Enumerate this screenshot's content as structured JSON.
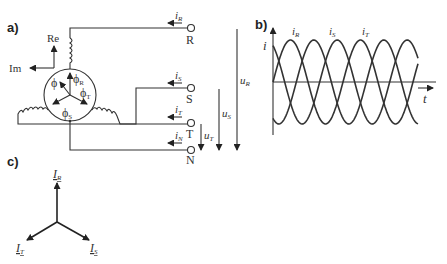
{
  "panels": {
    "a": {
      "label": "a)",
      "axes": {
        "re": "Re",
        "im": "Im"
      },
      "fluxes": [
        {
          "sym": "ϕ",
          "sub": "R"
        },
        {
          "sym": "ϕ",
          "sub": "T"
        },
        {
          "sym": "ϕ",
          "sub": "S"
        },
        {
          "sym": "ϕ",
          "sub": ""
        }
      ],
      "terminals": [
        {
          "name": "R",
          "current": "i",
          "current_sub": "R"
        },
        {
          "name": "S",
          "current": "i",
          "current_sub": "S"
        },
        {
          "name": "T",
          "current": "i",
          "current_sub": "T"
        },
        {
          "name": "N",
          "current": "i",
          "current_sub": "N"
        }
      ],
      "voltages": [
        {
          "sym": "u",
          "sub": "R"
        },
        {
          "sym": "u",
          "sub": "S"
        },
        {
          "sym": "u",
          "sub": "T"
        }
      ]
    },
    "b": {
      "label": "b)",
      "y_axis": "i",
      "x_axis": "t",
      "curves": [
        {
          "sym": "i",
          "sub": "R"
        },
        {
          "sym": "i",
          "sub": "S"
        },
        {
          "sym": "i",
          "sub": "T"
        }
      ]
    },
    "c": {
      "label": "c)",
      "phasors": [
        {
          "sym": "I",
          "sub": "R"
        },
        {
          "sym": "I",
          "sub": "T"
        },
        {
          "sym": "I",
          "sub": "S"
        }
      ]
    }
  },
  "chart_data": {
    "type": "line",
    "xlabel": "t",
    "ylabel": "i",
    "grid": false,
    "series": [
      {
        "name": "i_R",
        "phase_deg": 0
      },
      {
        "name": "i_S",
        "phase_deg": -120
      },
      {
        "name": "i_T",
        "phase_deg": -240
      }
    ],
    "periods_shown": 1.75
  }
}
